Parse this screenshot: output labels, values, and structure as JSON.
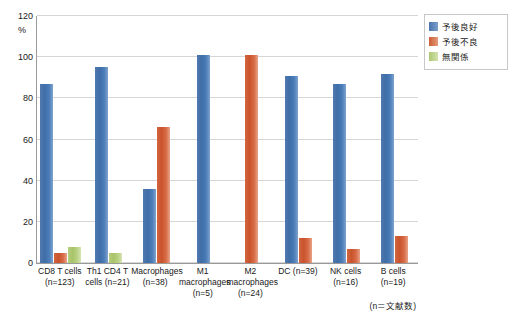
{
  "chart_data": {
    "type": "bar",
    "title": "",
    "xlabel": "",
    "ylabel": "%",
    "ylim": [
      0,
      120
    ],
    "yticks": [
      0,
      20,
      40,
      60,
      80,
      100,
      120
    ],
    "ytick_labels": [
      "0",
      "20",
      "40",
      "60",
      "80",
      "100",
      "120"
    ],
    "grid": true,
    "legend_position": "right-top",
    "categories": [
      "CD8 T cells (n=123)",
      "Th1 CD4 T cells (n=21)",
      "Macrophages (n=38)",
      "M1 macrophages (n=5)",
      "M2 macrophages (n=24)",
      "DC (n=39)",
      "NK cells (n=16)",
      "B cells (n=19)"
    ],
    "category_lines": [
      [
        "CD8 T cells",
        "(n=123)"
      ],
      [
        "Th1 CD4 T",
        "cells (n=21)"
      ],
      [
        "Macrophages",
        "(n=38)"
      ],
      [
        "M1",
        "macrophages",
        "(n=5)"
      ],
      [
        "M2",
        "macrophages",
        "(n=24)"
      ],
      [
        "DC (n=39)"
      ],
      [
        "NK cells",
        "(n=16)"
      ],
      [
        "B cells (n=19)"
      ]
    ],
    "series": [
      {
        "name": "予後良好",
        "color": "#4a74ac",
        "values": [
          87,
          95,
          36,
          101,
          0,
          91,
          87,
          92
        ]
      },
      {
        "name": "予後不良",
        "color": "#cd5c34",
        "values": [
          5,
          0,
          66,
          0,
          101,
          12,
          7,
          13
        ]
      },
      {
        "name": "無関係",
        "color": "#aec773",
        "values": [
          8,
          5,
          0,
          0,
          0,
          0,
          0,
          0
        ]
      }
    ],
    "footnote": "(n＝文献数)"
  },
  "legend": {
    "items": [
      {
        "label": "予後良好"
      },
      {
        "label": "予後不良"
      },
      {
        "label": "無関係"
      }
    ]
  },
  "axis": {
    "unit_label": "%"
  }
}
